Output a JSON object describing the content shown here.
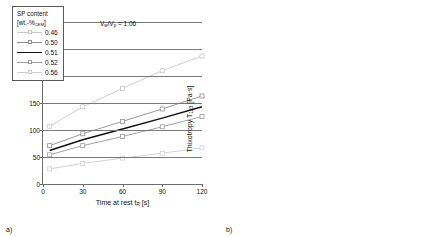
{
  "figure": {
    "panel_a_label": "a)",
    "panel_b_label": "b)"
  },
  "chart_data": [
    {
      "type": "line",
      "panel": "a)",
      "title": "",
      "xlabel": "Time at rest tR [s]",
      "ylabel": "Yield stress τmax [Pa]",
      "xlim": [
        0,
        120
      ],
      "ylim": [
        0,
        300
      ],
      "xticks": [
        0,
        30,
        60,
        90,
        120
      ],
      "yticks": [
        0,
        50,
        100,
        150,
        200,
        250,
        300
      ],
      "grid": true,
      "annotation": "Vw/Vp = 1.06",
      "legend_title_line1": "SP content",
      "legend_title_line2": "[wt.-%CEM]",
      "legend_position": "upper-left-inside",
      "x": [
        5,
        30,
        60,
        90,
        120
      ],
      "series": [
        {
          "name": "0.46",
          "color": "#c9c9c9",
          "marker": "open-square",
          "values": [
            107,
            143,
            177,
            210,
            237
          ]
        },
        {
          "name": "0.50",
          "color": "#8f8f8f",
          "marker": "open-square",
          "values": [
            71,
            93,
            116,
            139,
            163
          ]
        },
        {
          "name": "0.51",
          "color": "#111111",
          "marker": "none",
          "values": [
            62,
            82,
            102,
            122,
            143
          ]
        },
        {
          "name": "0.52",
          "color": "#9a9a9a",
          "marker": "open-square",
          "values": [
            54,
            71,
            88,
            106,
            125
          ]
        },
        {
          "name": "0.56",
          "color": "#cfcfcf",
          "marker": "open-square",
          "values": [
            28,
            38,
            48,
            57,
            67
          ]
        }
      ]
    },
    {
      "type": "scatter",
      "panel": "b)",
      "title": "",
      "xlabel": "SP-Content [wt.%CEM]",
      "ylabel": "Thixotropy T120 [Pa·s]",
      "xlim": [
        0.0,
        0.8
      ],
      "ylim": [
        0.0,
        2.0
      ],
      "xticks": [
        "0.0",
        "0.2",
        "0.4",
        "0.6",
        "0.8"
      ],
      "yticks": [
        "0.0",
        "0.2",
        "0.4",
        "0.6",
        "0.8",
        "1.0",
        "1.2",
        "1.4",
        "1.6",
        "1.8",
        "2.0"
      ],
      "grid": true,
      "annotation": "Vw/Vp = 1.06",
      "points": [
        {
          "x": 0.46,
          "y": 1.22,
          "label": "-0.05",
          "filled": false,
          "bold": false,
          "label_dx": -12,
          "label_dy": -11
        },
        {
          "x": 0.5,
          "y": 0.8,
          "label": "-0.01",
          "filled": false,
          "bold": false,
          "label_dx": -12,
          "label_dy": -11
        },
        {
          "x": 0.51,
          "y": 0.74,
          "label": "0.51",
          "filled": true,
          "bold": true,
          "label_dx": -16,
          "label_dy": -4
        },
        {
          "x": 0.52,
          "y": 0.61,
          "label": "+0.01",
          "filled": false,
          "bold": false,
          "label_dx": -11,
          "label_dy": 3
        },
        {
          "x": 0.56,
          "y": 0.41,
          "label": "+0.05",
          "filled": false,
          "bold": false,
          "label_dx": -13,
          "label_dy": 3
        }
      ]
    }
  ]
}
